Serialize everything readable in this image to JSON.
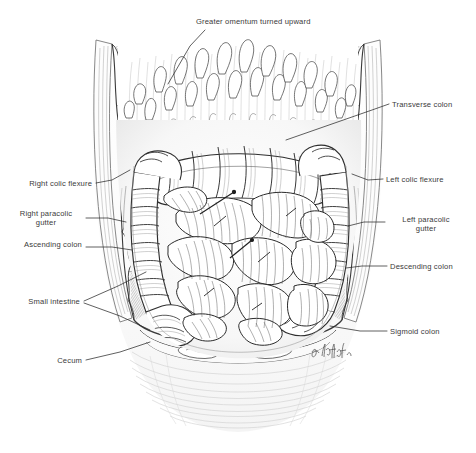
{
  "figure": {
    "kind": "anatomical-illustration",
    "medium": "pen-and-ink stipple drawing",
    "artist_signature": "A. Kmit",
    "ink_color": "#2b2b2b",
    "paper_color": "#ffffff",
    "label_color": "#3a3a3a"
  },
  "labels": [
    {
      "id": "greater-omentum",
      "text": "Greater omentum turned upward",
      "align": "left",
      "x": 196,
      "y": 17
    },
    {
      "id": "transverse-colon",
      "text": "Transverse colon",
      "align": "left",
      "x": 392,
      "y": 100
    },
    {
      "id": "left-colic-flexure",
      "text": "Left colic flexure",
      "align": "left",
      "x": 386,
      "y": 175
    },
    {
      "id": "left-paracolic",
      "text": "Left paracolic\ngutter",
      "align": "center",
      "x": 390,
      "y": 222
    },
    {
      "id": "descending-colon",
      "text": "Descending colon",
      "align": "left",
      "x": 390,
      "y": 262
    },
    {
      "id": "sigmoid-colon",
      "text": "Sigmoid colon",
      "align": "left",
      "x": 390,
      "y": 327
    },
    {
      "id": "right-colic-flexure",
      "text": "Right colic flexure",
      "align": "right",
      "x": 20,
      "y": 179
    },
    {
      "id": "right-paracolic",
      "text": "Right paracolic\ngutter",
      "align": "center",
      "x": 22,
      "y": 214
    },
    {
      "id": "ascending-colon",
      "text": "Ascending colon",
      "align": "right",
      "x": 20,
      "y": 243
    },
    {
      "id": "small-intestine",
      "text": "Small intestine",
      "align": "right",
      "x": 18,
      "y": 298
    },
    {
      "id": "cecum",
      "text": "Cecum",
      "align": "right",
      "x": 48,
      "y": 357
    }
  ],
  "leader_lines": [
    {
      "id": "leader-greater-omentum",
      "points": "205,30 190,46 168,84"
    },
    {
      "id": "leader-transverse-colon",
      "points": "389,104 372,110 286,140"
    },
    {
      "id": "leader-left-colic-flexure",
      "points": "383,179 368,180 352,174"
    },
    {
      "id": "leader-left-paracolic",
      "points": "385,222 364,222 348,226"
    },
    {
      "id": "leader-descending-colon",
      "points": "387,266 362,266 346,268"
    },
    {
      "id": "leader-sigmoid-colon",
      "points": "387,331 360,331 330,326"
    },
    {
      "id": "leader-right-colic-flexure",
      "points": "96,183 112,180 130,170"
    },
    {
      "id": "leader-right-paracolic",
      "points": "86,218 108,218 126,222"
    },
    {
      "id": "leader-ascending-colon",
      "points": "86,247 112,247 132,250"
    },
    {
      "id": "leader-small-intestine-a",
      "points": "84,301 118,286 146,272"
    },
    {
      "id": "leader-small-intestine-b",
      "points": "84,303 120,316 150,330"
    },
    {
      "id": "leader-cecum",
      "points": "86,360 120,352 150,342"
    }
  ]
}
